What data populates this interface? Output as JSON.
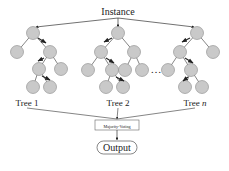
{
  "diagram": {
    "input_label": "Instance",
    "vote_label": "Majority-Voting",
    "output_label": "Output",
    "ellipsis": "…",
    "colors": {
      "node_fill": "#c9c9c9",
      "node_stroke": "#8a8a8a",
      "edge": "#333333",
      "path_arrow": "#222222"
    },
    "trees": [
      {
        "label": "Tree 1",
        "label_italic_suffix": "",
        "label_x": 27,
        "root_x": 33,
        "nodes": [
          [
            33,
            33
          ],
          [
            17,
            52
          ],
          [
            50,
            52
          ],
          [
            39,
            69
          ],
          [
            61,
            69
          ],
          [
            33,
            87
          ],
          [
            50,
            87
          ]
        ],
        "edges": [
          [
            0,
            1
          ],
          [
            0,
            2
          ],
          [
            2,
            3
          ],
          [
            2,
            4
          ],
          [
            3,
            5
          ],
          [
            3,
            6
          ]
        ],
        "path_arrows": [
          [
            38,
            38,
            46,
            43
          ],
          [
            44,
            58,
            38,
            61
          ],
          [
            42,
            76,
            50,
            80
          ]
        ]
      },
      {
        "label": "Tree 2",
        "label_italic_suffix": "",
        "label_x": 118,
        "root_x": 118,
        "nodes": [
          [
            118,
            33
          ],
          [
            101,
            52
          ],
          [
            134,
            52
          ],
          [
            88,
            70
          ],
          [
            112,
            70
          ],
          [
            125,
            70
          ],
          [
            142,
            70
          ],
          [
            106,
            87
          ],
          [
            123,
            87
          ]
        ],
        "edges": [
          [
            0,
            1
          ],
          [
            0,
            2
          ],
          [
            1,
            3
          ],
          [
            1,
            4
          ],
          [
            2,
            5
          ],
          [
            2,
            6
          ],
          [
            4,
            7
          ],
          [
            4,
            8
          ]
        ],
        "path_arrows": [
          [
            112,
            38,
            104,
            42
          ],
          [
            106,
            58,
            114,
            63
          ],
          [
            116,
            77,
            124,
            81
          ]
        ]
      },
      {
        "label": "Tree ",
        "label_italic_suffix": "n",
        "label_x": 195,
        "root_x": 197,
        "nodes": [
          [
            197,
            33
          ],
          [
            180,
            52
          ],
          [
            213,
            52
          ],
          [
            168,
            70
          ],
          [
            191,
            70
          ],
          [
            185,
            87
          ],
          [
            202,
            87
          ]
        ],
        "edges": [
          [
            0,
            1
          ],
          [
            0,
            2
          ],
          [
            1,
            3
          ],
          [
            1,
            4
          ],
          [
            4,
            5
          ],
          [
            4,
            6
          ]
        ],
        "path_arrows": [
          [
            190,
            38,
            182,
            42
          ],
          [
            185,
            58,
            193,
            63
          ],
          [
            188,
            77,
            183,
            81
          ]
        ]
      }
    ]
  }
}
